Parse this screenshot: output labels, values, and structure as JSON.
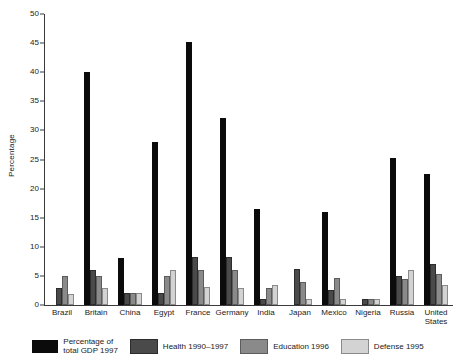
{
  "chart_data": {
    "type": "bar",
    "title": "",
    "xlabel": "",
    "ylabel": "Percentage",
    "ylim": [
      0,
      50
    ],
    "yticks": [
      0,
      5,
      10,
      15,
      20,
      25,
      30,
      35,
      40,
      45,
      50
    ],
    "grid": false,
    "legend_position": "bottom",
    "categories": [
      "Brazil",
      "Britain",
      "China",
      "Egypt",
      "France",
      "Germany",
      "India",
      "Japan",
      "Mexico",
      "Nigeria",
      "Russia",
      "United States"
    ],
    "series": [
      {
        "name": "Percentage of\ntotal GDP 1997",
        "color": "#0b0b0b",
        "values": [
          null,
          40.1,
          8.1,
          28.0,
          45.2,
          32.1,
          16.5,
          null,
          16.0,
          null,
          25.2,
          22.5
        ]
      },
      {
        "name": "Health 1990–1997",
        "color": "#4a4a4a",
        "values": [
          3.0,
          6.0,
          2.0,
          2.0,
          8.2,
          8.2,
          1.0,
          6.2,
          2.6,
          1.0,
          5.0,
          7.1
        ]
      },
      {
        "name": "Education 1996",
        "color": "#8a8a8a",
        "values": [
          5.0,
          5.0,
          2.0,
          5.0,
          6.0,
          6.0,
          3.0,
          4.0,
          4.6,
          1.0,
          4.5,
          5.4
        ]
      },
      {
        "name": "Defense 1995",
        "color": "#d3d3d3",
        "values": [
          1.9,
          3.0,
          2.0,
          6.1,
          3.1,
          3.0,
          3.4,
          1.0,
          1.0,
          1.0,
          6.0,
          3.5
        ]
      }
    ]
  },
  "legend": {
    "items": [
      {
        "label": "Percentage of\ntotal GDP 1997",
        "color": "#0b0b0b"
      },
      {
        "label": "Health 1990–1997",
        "color": "#4a4a4a"
      },
      {
        "label": "Education 1996",
        "color": "#8a8a8a"
      },
      {
        "label": "Defense 1995",
        "color": "#d3d3d3"
      }
    ]
  }
}
